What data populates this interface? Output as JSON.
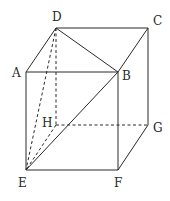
{
  "figure": {
    "type": "rectangular-prism",
    "vertices": {
      "A": {
        "label": "A",
        "x": 26,
        "y": 72,
        "lx": 12,
        "ly": 77
      },
      "B": {
        "label": "B",
        "x": 118,
        "y": 72,
        "lx": 122,
        "ly": 80
      },
      "C": {
        "label": "C",
        "x": 148,
        "y": 28,
        "lx": 153,
        "ly": 25
      },
      "D": {
        "label": "D",
        "x": 56,
        "y": 28,
        "lx": 52,
        "ly": 21
      },
      "E": {
        "label": "E",
        "x": 26,
        "y": 170,
        "lx": 18,
        "ly": 187
      },
      "F": {
        "label": "F",
        "x": 118,
        "y": 170,
        "lx": 114,
        "ly": 187
      },
      "G": {
        "label": "G",
        "x": 148,
        "y": 125,
        "lx": 153,
        "ly": 132
      },
      "H": {
        "label": "H",
        "x": 56,
        "y": 125,
        "lx": 42,
        "ly": 127
      }
    },
    "solid_edges": [
      [
        "D",
        "C"
      ],
      [
        "A",
        "B"
      ],
      [
        "D",
        "A"
      ],
      [
        "D",
        "B"
      ],
      [
        "C",
        "B"
      ],
      [
        "C",
        "G"
      ],
      [
        "A",
        "E"
      ],
      [
        "B",
        "F"
      ],
      [
        "E",
        "F"
      ],
      [
        "F",
        "G"
      ],
      [
        "E",
        "B"
      ]
    ],
    "dashed_edges": [
      [
        "D",
        "H"
      ],
      [
        "H",
        "G"
      ],
      [
        "H",
        "E"
      ],
      [
        "D",
        "E"
      ]
    ],
    "colors": {
      "line": "#2a2a2a",
      "background": "#ffffff"
    }
  }
}
